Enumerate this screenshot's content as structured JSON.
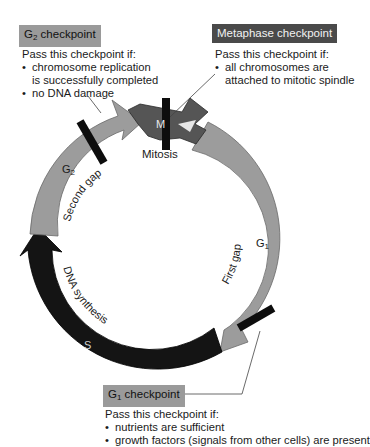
{
  "g2_checkpoint": {
    "title_main": "G",
    "title_sub": "2",
    "title_rest": " checkpoint",
    "intro": "Pass this checkpoint if:",
    "bullets": [
      "chromosome replication",
      "no DNA damage"
    ],
    "bullet1_continuation": "is successfully completed"
  },
  "metaphase_checkpoint": {
    "title": "Metaphase checkpoint",
    "intro": "Pass this checkpoint if:",
    "bullet": "all chromosomes are",
    "bullet_continuation": "attached to mitotic spindle"
  },
  "g1_checkpoint": {
    "title_main": "G",
    "title_sub": "1",
    "title_rest": " checkpoint",
    "intro": "Pass this checkpoint if:",
    "bullets": [
      "nutrients are sufficient",
      "growth factors (signals from other cells) are present"
    ]
  },
  "phases": {
    "m": {
      "label": "M",
      "name": "Mitosis"
    },
    "g1": {
      "label_main": "G",
      "label_sub": "1",
      "name": "First gap"
    },
    "s": {
      "label": "S",
      "name": "DNA synthesis"
    },
    "g2": {
      "label_main": "G",
      "label_sub": "2",
      "name": "Second gap"
    }
  },
  "bullet_char": "•",
  "colors": {
    "g_phase": "#9c9c9c",
    "s_phase": "#141414",
    "m_phase": "#555555",
    "checkpoint_bar": "#0d0d0d",
    "tag_light": "#9a9a9a",
    "tag_dark": "#4a4a4a"
  }
}
